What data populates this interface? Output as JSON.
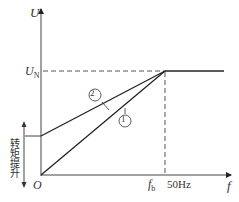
{
  "axes": {
    "y_label": "U",
    "x_label": "f",
    "origin": "O"
  },
  "levels": {
    "rated_voltage": "U",
    "rated_voltage_sub": "N",
    "base_freq": "f",
    "base_freq_sub": "b",
    "base_freq_value": "50Hz"
  },
  "curves": [
    {
      "id": "1",
      "label": "①",
      "description": "linear V/f from origin"
    },
    {
      "id": "2",
      "label": "②",
      "description": "V/f with torque boost offset"
    }
  ],
  "annotations": {
    "torque_boost": "转矩提升"
  },
  "colors": {
    "line": "#222222",
    "dashed": "#555555"
  }
}
